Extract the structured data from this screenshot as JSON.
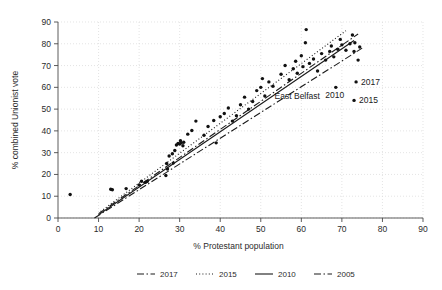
{
  "chart_data": {
    "type": "scatter",
    "title": "",
    "xlabel": "% Protestant population",
    "ylabel": "% combined Unionist vote",
    "xlim": [
      0,
      90
    ],
    "ylim": [
      0,
      90
    ],
    "xticks": [
      0,
      10,
      20,
      30,
      40,
      50,
      60,
      70,
      80,
      90
    ],
    "yticks": [
      0,
      10,
      20,
      30,
      40,
      50,
      60,
      70,
      80,
      90
    ],
    "grid": true,
    "legend_position": "bottom",
    "marker_color": "#111111",
    "line_color": "#1a1a1a",
    "grid_color": "#d8d8d8",
    "axis_color": "#4a4a4a",
    "points": [
      [
        3.0,
        10.8
      ],
      [
        13.0,
        13.2
      ],
      [
        13.4,
        13.0
      ],
      [
        16.8,
        13.5
      ],
      [
        20.0,
        15.2
      ],
      [
        20.6,
        16.9
      ],
      [
        21.6,
        16.4
      ],
      [
        22.0,
        16.8
      ],
      [
        26.6,
        19.5
      ],
      [
        27.0,
        22.5
      ],
      [
        26.8,
        25.0
      ],
      [
        28.4,
        25.2
      ],
      [
        27.4,
        28.5
      ],
      [
        28.2,
        29.5
      ],
      [
        28.8,
        31.0
      ],
      [
        29.2,
        33.5
      ],
      [
        29.6,
        34.2
      ],
      [
        30.0,
        34.0
      ],
      [
        30.4,
        34.5
      ],
      [
        30.2,
        35.5
      ],
      [
        31.0,
        34.8
      ],
      [
        30.8,
        33.2
      ],
      [
        32.0,
        38.5
      ],
      [
        33.0,
        40.2
      ],
      [
        34.0,
        44.5
      ],
      [
        36.0,
        38.0
      ],
      [
        37.0,
        42.0
      ],
      [
        38.4,
        44.8
      ],
      [
        39.0,
        34.5
      ],
      [
        40.0,
        46.5
      ],
      [
        41.0,
        48.0
      ],
      [
        42.0,
        50.5
      ],
      [
        43.0,
        44.5
      ],
      [
        44.0,
        47.0
      ],
      [
        45.0,
        52.0
      ],
      [
        46.0,
        55.5
      ],
      [
        47.0,
        50.0
      ],
      [
        48.0,
        53.5
      ],
      [
        49.0,
        58.5
      ],
      [
        50.0,
        60.0
      ],
      [
        50.4,
        64.0
      ],
      [
        51.0,
        56.0
      ],
      [
        52.0,
        62.5
      ],
      [
        53.0,
        60.5
      ],
      [
        55.0,
        66.0
      ],
      [
        56.0,
        70.0
      ],
      [
        57.0,
        63.5
      ],
      [
        58.0,
        68.5
      ],
      [
        58.6,
        72.0
      ],
      [
        59.0,
        66.5
      ],
      [
        60.0,
        74.5
      ],
      [
        60.4,
        69.5
      ],
      [
        61.0,
        80.5
      ],
      [
        61.2,
        86.5
      ],
      [
        62.0,
        71.0
      ],
      [
        63.0,
        73.0
      ],
      [
        64.0,
        67.5
      ],
      [
        65.0,
        75.5
      ],
      [
        66.0,
        72.5
      ],
      [
        67.0,
        76.5
      ],
      [
        67.4,
        79.0
      ],
      [
        68.0,
        74.0
      ],
      [
        69.0,
        77.5
      ],
      [
        69.6,
        82.0
      ],
      [
        70.0,
        79.5
      ],
      [
        71.0,
        77.0
      ],
      [
        72.0,
        80.0
      ],
      [
        73.0,
        76.5
      ],
      [
        74.0,
        72.5
      ],
      [
        74.4,
        78.5
      ],
      [
        72.6,
        84.0
      ],
      [
        73.2,
        80.5
      ]
    ],
    "annotated_points": [
      {
        "label": "2017",
        "x": 73.5,
        "y": 62.5
      },
      {
        "label": "2010",
        "x": 68.5,
        "y": 60.0
      },
      {
        "label": "2015",
        "x": 73.0,
        "y": 54.0
      }
    ],
    "annotations": [
      {
        "text": "East Belfast",
        "x": 59.0,
        "y": 54.5
      }
    ],
    "series": [
      {
        "name": "2017",
        "style": "dash-dot",
        "endpoints": [
          [
            10.0,
            2.0
          ],
          [
            74.0,
            84.5
          ]
        ]
      },
      {
        "name": "2015",
        "style": "dotted",
        "endpoints": [
          [
            10.5,
            3.0
          ],
          [
            71.0,
            86.0
          ]
        ]
      },
      {
        "name": "2010",
        "style": "solid",
        "endpoints": [
          [
            10.0,
            1.5
          ],
          [
            73.0,
            81.5
          ]
        ]
      },
      {
        "name": "2005",
        "style": "dash-dot",
        "endpoints": [
          [
            9.0,
            0.0
          ],
          [
            75.0,
            78.0
          ]
        ]
      }
    ]
  },
  "legend": {
    "items": [
      {
        "label": "2017",
        "style": "dash-dot"
      },
      {
        "label": "2015",
        "style": "dotted"
      },
      {
        "label": "2010",
        "style": "solid"
      },
      {
        "label": "2005",
        "style": "dash-dot"
      }
    ]
  }
}
